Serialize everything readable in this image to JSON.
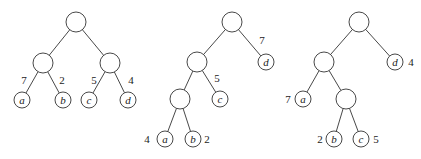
{
  "trees": [
    {
      "name": "tree-1",
      "nodes": [
        {
          "id": "r",
          "x": 76,
          "y": 22,
          "r": 10,
          "label": ""
        },
        {
          "id": "L",
          "x": 43,
          "y": 63,
          "r": 10,
          "label": ""
        },
        {
          "id": "R",
          "x": 110,
          "y": 63,
          "r": 10,
          "label": ""
        },
        {
          "id": "a",
          "x": 22,
          "y": 100,
          "r": 8,
          "label": "a",
          "weight": "7",
          "wx": 24,
          "wy": 84
        },
        {
          "id": "b",
          "x": 63,
          "y": 100,
          "r": 8,
          "label": "b",
          "weight": "2",
          "wx": 62,
          "wy": 84
        },
        {
          "id": "c",
          "x": 89,
          "y": 100,
          "r": 8,
          "label": "c",
          "weight": "5",
          "wx": 94,
          "wy": 84
        },
        {
          "id": "d",
          "x": 128,
          "y": 100,
          "r": 8,
          "label": "d",
          "weight": "4",
          "wx": 131,
          "wy": 84
        }
      ],
      "edges": [
        [
          "r",
          "L"
        ],
        [
          "r",
          "R"
        ],
        [
          "L",
          "a"
        ],
        [
          "L",
          "b"
        ],
        [
          "R",
          "c"
        ],
        [
          "R",
          "d"
        ]
      ]
    },
    {
      "name": "tree-2",
      "nodes": [
        {
          "id": "r",
          "x": 232,
          "y": 22,
          "r": 10,
          "label": ""
        },
        {
          "id": "n1",
          "x": 197,
          "y": 62,
          "r": 10,
          "label": ""
        },
        {
          "id": "d",
          "x": 266,
          "y": 62,
          "r": 8,
          "label": "d",
          "weight": "7",
          "wx": 262,
          "wy": 44
        },
        {
          "id": "n2",
          "x": 180,
          "y": 99,
          "r": 10,
          "label": ""
        },
        {
          "id": "c",
          "x": 220,
          "y": 99,
          "r": 8,
          "label": "c",
          "weight": "5",
          "wx": 217,
          "wy": 82
        },
        {
          "id": "a",
          "x": 165,
          "y": 139,
          "r": 8,
          "label": "a",
          "weight": "4",
          "wx": 147,
          "wy": 143
        },
        {
          "id": "b",
          "x": 193,
          "y": 139,
          "r": 8,
          "label": "b",
          "weight": "2",
          "wx": 207,
          "wy": 143
        }
      ],
      "edges": [
        [
          "r",
          "n1"
        ],
        [
          "r",
          "d"
        ],
        [
          "n1",
          "n2"
        ],
        [
          "n1",
          "c"
        ],
        [
          "n2",
          "a"
        ],
        [
          "n2",
          "b"
        ]
      ]
    },
    {
      "name": "tree-3",
      "nodes": [
        {
          "id": "r",
          "x": 359,
          "y": 22,
          "r": 10,
          "label": ""
        },
        {
          "id": "n1",
          "x": 324,
          "y": 62,
          "r": 10,
          "label": ""
        },
        {
          "id": "d",
          "x": 395,
          "y": 62,
          "r": 8,
          "label": "d",
          "weight": "4",
          "wx": 411,
          "wy": 66
        },
        {
          "id": "a",
          "x": 303,
          "y": 99,
          "r": 8,
          "label": "a",
          "weight": "7",
          "wx": 288,
          "wy": 103
        },
        {
          "id": "n2",
          "x": 346,
          "y": 99,
          "r": 10,
          "label": ""
        },
        {
          "id": "b",
          "x": 334,
          "y": 139,
          "r": 8,
          "label": "b",
          "weight": "2",
          "wx": 320,
          "wy": 143
        },
        {
          "id": "c",
          "x": 361,
          "y": 139,
          "r": 8,
          "label": "c",
          "weight": "5",
          "wx": 376,
          "wy": 143
        }
      ],
      "edges": [
        [
          "r",
          "n1"
        ],
        [
          "r",
          "d"
        ],
        [
          "n1",
          "a"
        ],
        [
          "n1",
          "n2"
        ],
        [
          "n2",
          "b"
        ],
        [
          "n2",
          "c"
        ]
      ]
    }
  ]
}
